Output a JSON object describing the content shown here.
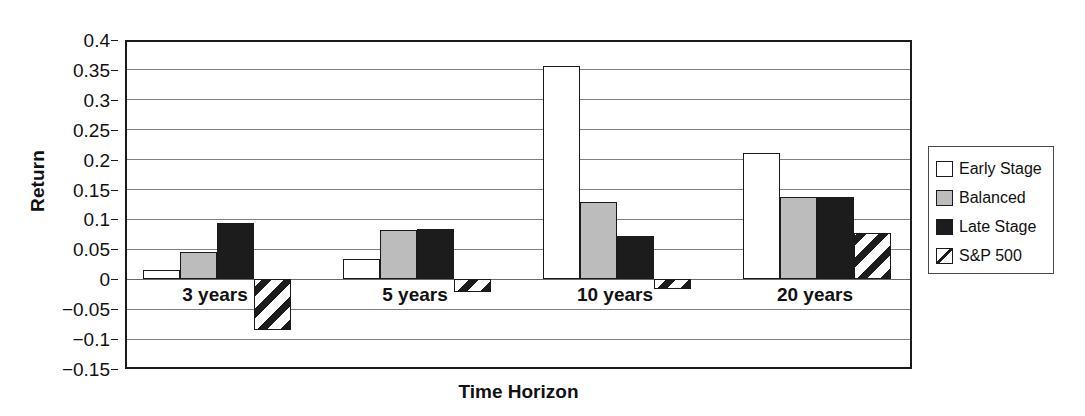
{
  "chart_data": {
    "type": "bar",
    "title": "",
    "xlabel": "Time Horizon",
    "ylabel": "Return",
    "categories": [
      "3 years",
      "5 years",
      "10 years",
      "20 years"
    ],
    "ylim": [
      -0.15,
      0.4
    ],
    "ytick_values": [
      0.4,
      0.35,
      0.3,
      0.25,
      0.2,
      0.15,
      0.1,
      0.05,
      0,
      -0.05,
      -0.1,
      -0.15
    ],
    "ytick_labels": [
      "0.4",
      "0.35",
      "0.3",
      "0.25",
      "0.2",
      "0.15",
      "0.1",
      "0.05",
      "0",
      "−0.05",
      "−0.1",
      "−0.15"
    ],
    "grid": true,
    "legend_position": "right",
    "series": [
      {
        "name": "Early Stage",
        "key": "early",
        "color": "#ffffff",
        "pattern": "solid",
        "values": [
          0.015,
          0.033,
          0.355,
          0.21
        ]
      },
      {
        "name": "Balanced",
        "key": "balanced",
        "color": "#bcbcbc",
        "pattern": "solid",
        "values": [
          0.044,
          0.081,
          0.128,
          0.137
        ]
      },
      {
        "name": "Late Stage",
        "key": "late",
        "color": "#1c1c1c",
        "pattern": "solid",
        "values": [
          0.094,
          0.083,
          0.071,
          0.137
        ]
      },
      {
        "name": "S&P 500",
        "key": "sp500",
        "color": "#ffffff",
        "pattern": "hatch",
        "values": [
          -0.085,
          -0.022,
          -0.017,
          0.077
        ]
      }
    ]
  },
  "legend": {
    "items": [
      {
        "label": "Early Stage",
        "swatch": "early"
      },
      {
        "label": "Balanced",
        "swatch": "balanced"
      },
      {
        "label": "Late Stage",
        "swatch": "late"
      },
      {
        "label": "S&P 500",
        "swatch": "sp500"
      }
    ]
  },
  "axes": {
    "y_title": "Return",
    "x_title": "Time Horizon"
  }
}
